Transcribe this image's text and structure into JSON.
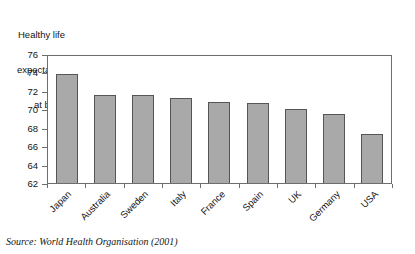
{
  "chart_data": {
    "type": "bar",
    "title": "Healthy life expectancy at birth",
    "title_lines": [
      "Healthy life",
      "expectancy",
      "at birth"
    ],
    "xlabel": "",
    "ylabel": "",
    "categories": [
      "Japan",
      "Australia",
      "Sweden",
      "Italy",
      "France",
      "Spain",
      "UK",
      "Germany",
      "USA"
    ],
    "values": [
      73.8,
      71.5,
      71.5,
      71.2,
      70.8,
      70.7,
      70.0,
      69.5,
      67.3
    ],
    "ylim": [
      62,
      76
    ],
    "ytick_values": [
      76,
      74,
      72,
      70,
      68,
      66,
      64,
      62
    ],
    "ytick_labels": [
      "76",
      "74",
      "72",
      "70",
      "68",
      "66",
      "64",
      "62"
    ],
    "grid": false,
    "legend": null,
    "bar_color": "#a9a9a9",
    "bar_border_color": "#555555",
    "axis_color": "#6e6e6e",
    "annotations": [
      "Source: World Health Organisation (2001)"
    ]
  },
  "source": {
    "text": "Source: World Health Organisation (2001)"
  }
}
